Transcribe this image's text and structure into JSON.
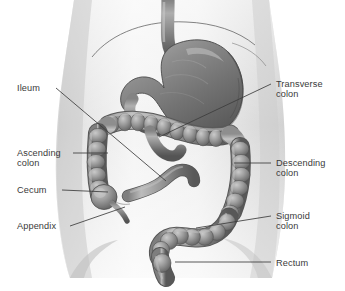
{
  "figure": {
    "view": "anterior",
    "style": "grayscale medical illustration",
    "width": 345,
    "height": 291,
    "colors": {
      "background": "#ffffff",
      "body_light": "#f2f2f2",
      "body_mid": "#dedede",
      "body_shadow": "#c4c4c4",
      "organ_light": "#b9b9b9",
      "organ_mid": "#8f8f8f",
      "organ_dark": "#5f5f5f",
      "organ_outline": "#4a4a4a",
      "leader_line": "#3c3c3c",
      "text": "#3a3a3a"
    }
  },
  "labels": [
    {
      "id": "ileum",
      "text": "Ileum",
      "side": "left",
      "x": 17,
      "y": 83,
      "leader": {
        "x1": 56,
        "y1": 88,
        "x2": 166,
        "y2": 181
      }
    },
    {
      "id": "ascending-colon",
      "text": "Ascending\ncolon",
      "side": "left",
      "x": 17,
      "y": 148,
      "leader": {
        "x1": 73,
        "y1": 153,
        "x2": 108,
        "y2": 153
      }
    },
    {
      "id": "cecum",
      "text": "Cecum",
      "side": "left",
      "x": 17,
      "y": 185,
      "leader": {
        "x1": 62,
        "y1": 190,
        "x2": 108,
        "y2": 192
      }
    },
    {
      "id": "appendix",
      "text": "Appendix",
      "side": "left",
      "x": 17,
      "y": 221,
      "leader": {
        "x1": 70,
        "y1": 226,
        "x2": 125,
        "y2": 207
      }
    },
    {
      "id": "transverse-colon",
      "text": "Transverse\ncolon",
      "side": "right",
      "x": 276,
      "y": 79,
      "leader": {
        "x1": 271,
        "y1": 84,
        "x2": 159,
        "y2": 137
      }
    },
    {
      "id": "descending-colon",
      "text": "Descending\ncolon",
      "side": "right",
      "x": 276,
      "y": 158,
      "leader": {
        "x1": 271,
        "y1": 163,
        "x2": 234,
        "y2": 163
      }
    },
    {
      "id": "sigmoid-colon",
      "text": "Sigmoid\ncolon",
      "side": "right",
      "x": 276,
      "y": 211,
      "leader": {
        "x1": 271,
        "y1": 216,
        "x2": 196,
        "y2": 228
      }
    },
    {
      "id": "rectum",
      "text": "Rectum",
      "side": "right",
      "x": 276,
      "y": 258,
      "leader": {
        "x1": 271,
        "y1": 262,
        "x2": 175,
        "y2": 262
      }
    }
  ],
  "structures": [
    {
      "id": "torso",
      "name": "abdominal torso silhouette"
    },
    {
      "id": "diaphragm",
      "name": "diaphragm / rib cage contour line"
    },
    {
      "id": "esophagus",
      "name": "esophagus"
    },
    {
      "id": "stomach",
      "name": "stomach"
    },
    {
      "id": "duodenum",
      "name": "duodenum loop"
    },
    {
      "id": "transverse-colon",
      "name": "transverse colon"
    },
    {
      "id": "ascending-colon",
      "name": "ascending colon"
    },
    {
      "id": "descending-colon",
      "name": "descending colon"
    },
    {
      "id": "cecum",
      "name": "cecum"
    },
    {
      "id": "appendix",
      "name": "vermiform appendix"
    },
    {
      "id": "ileum",
      "name": "ileum"
    },
    {
      "id": "sigmoid-colon",
      "name": "sigmoid colon"
    },
    {
      "id": "rectum",
      "name": "rectum"
    }
  ]
}
